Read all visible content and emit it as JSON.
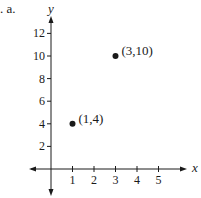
{
  "problem_label": ". a.",
  "chart_data": {
    "type": "scatter",
    "title": "",
    "xlabel": "x",
    "ylabel": "y",
    "x_ticks": [
      1,
      2,
      3,
      4,
      5
    ],
    "y_ticks": [
      2,
      4,
      6,
      8,
      10,
      12
    ],
    "xlim": [
      -1,
      6
    ],
    "ylim": [
      -1,
      13
    ],
    "grid": false,
    "points": [
      {
        "x": 1,
        "y": 4,
        "label": "(1,4)"
      },
      {
        "x": 3,
        "y": 10,
        "label": "(3,10)"
      }
    ]
  },
  "axis": {
    "x_label": "x",
    "y_label": "y"
  },
  "colors": {
    "ink": "#1a1a1a",
    "background": "#ffffff"
  }
}
